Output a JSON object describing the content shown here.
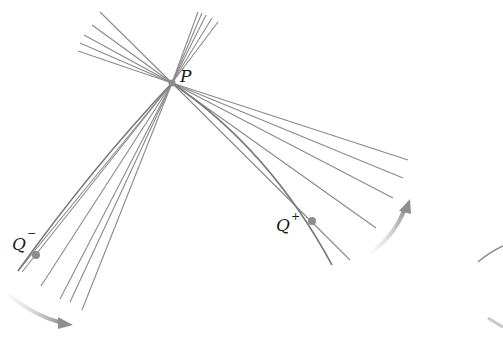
{
  "figure": {
    "colors": {
      "line": "#8a8a8a",
      "curve": "#7a7a7a",
      "point": "#8c8c8c",
      "arrow": "#a0a0a0",
      "text": "#1a1a1a"
    },
    "labels": {
      "P": "P",
      "Q_minus_base": "Q",
      "Q_minus_sup": "−",
      "Q_plus_base": "Q",
      "Q_plus_sup": "+"
    },
    "points": {
      "P": [
        172,
        83
      ],
      "Q_minus": [
        36,
        255
      ],
      "Q_plus": [
        312,
        221
      ]
    }
  }
}
